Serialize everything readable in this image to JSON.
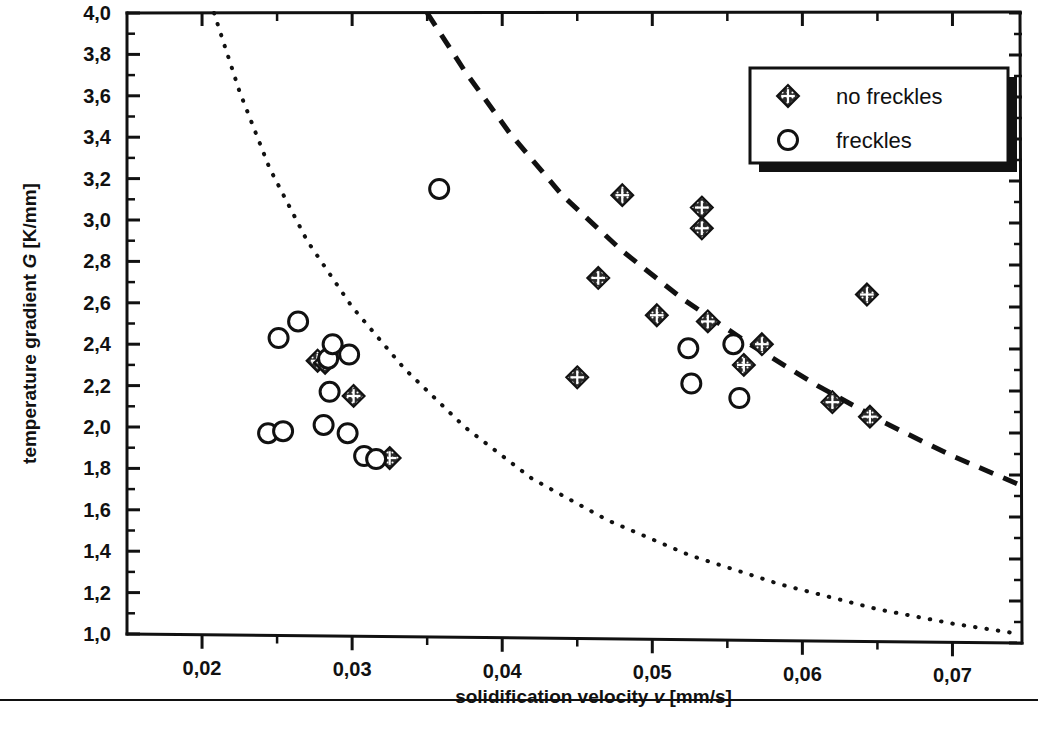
{
  "chart_data": {
    "type": "scatter",
    "title": "",
    "xlabel": "solidification velocity v [mm/s]",
    "xlabel_main": "solidification velocity",
    "xlabel_symbol": "v",
    "xlabel_unit": "[mm/s]",
    "ylabel": "temperature gradient  G [K/mm]",
    "ylabel_main": "temperature gradient",
    "ylabel_symbol": "G",
    "ylabel_unit": "[K/mm]",
    "xlim": [
      0.015,
      0.0745
    ],
    "ylim": [
      1.0,
      4.0
    ],
    "grid": false,
    "x_ticks_major": [
      0.02,
      0.03,
      0.04,
      0.05,
      0.06,
      0.07
    ],
    "x_tick_labels": [
      "0,02",
      "0,03",
      "0,04",
      "0,05",
      "0,06",
      "0,07"
    ],
    "x_ticks_minor": [
      0.025,
      0.035,
      0.045,
      0.055,
      0.065
    ],
    "y_ticks_major": [
      1.0,
      1.2,
      1.4,
      1.6,
      1.8,
      2.0,
      2.2,
      2.4,
      2.6,
      2.8,
      3.0,
      3.2,
      3.4,
      3.6,
      3.8,
      4.0
    ],
    "y_tick_labels": [
      "1,0",
      "1,2",
      "1,4",
      "1,6",
      "1,8",
      "2,0",
      "2,2",
      "2,4",
      "2,6",
      "2,8",
      "3,0",
      "3,2",
      "3,4",
      "3,6",
      "3,8",
      "4,0"
    ],
    "y_ticks_minor": [
      1.1,
      1.3,
      1.5,
      1.7,
      1.9,
      2.1,
      2.3,
      2.5,
      2.7,
      2.9,
      3.1,
      3.3,
      3.5,
      3.7,
      3.9
    ],
    "legend_position": "top-right",
    "series": [
      {
        "name": "no freckles",
        "marker": "diamond-crosshatch",
        "points": [
          [
            0.0301,
            2.15
          ],
          [
            0.0325,
            1.85
          ],
          [
            0.045,
            2.24
          ],
          [
            0.0464,
            2.72
          ],
          [
            0.048,
            3.12
          ],
          [
            0.0503,
            2.54
          ],
          [
            0.0533,
            3.06
          ],
          [
            0.0533,
            2.96
          ],
          [
            0.0537,
            2.51
          ],
          [
            0.0561,
            2.3
          ],
          [
            0.0573,
            2.4
          ],
          [
            0.062,
            2.12
          ],
          [
            0.0643,
            2.64
          ],
          [
            0.0645,
            2.05
          ],
          [
            0.0277,
            2.32
          ],
          [
            0.0282,
            2.31
          ]
        ]
      },
      {
        "name": "freckles",
        "marker": "open-circle",
        "points": [
          [
            0.0244,
            1.97
          ],
          [
            0.0251,
            2.43
          ],
          [
            0.0254,
            1.98
          ],
          [
            0.0264,
            2.51
          ],
          [
            0.0281,
            2.01
          ],
          [
            0.0284,
            2.33
          ],
          [
            0.0285,
            2.17
          ],
          [
            0.0287,
            2.4
          ],
          [
            0.0297,
            1.97
          ],
          [
            0.0298,
            2.35
          ],
          [
            0.0308,
            1.86
          ],
          [
            0.0316,
            1.845
          ],
          [
            0.0358,
            3.15
          ],
          [
            0.0524,
            2.38
          ],
          [
            0.0526,
            2.21
          ],
          [
            0.0554,
            2.4
          ],
          [
            0.0558,
            2.14
          ]
        ]
      }
    ],
    "curves": [
      {
        "name": "lower-criterion-curve",
        "style": "dotted",
        "points": [
          [
            0.0208,
            4.0
          ],
          [
            0.0225,
            3.62
          ],
          [
            0.0245,
            3.25
          ],
          [
            0.027,
            2.9
          ],
          [
            0.03,
            2.58
          ],
          [
            0.0335,
            2.28
          ],
          [
            0.0375,
            2.0
          ],
          [
            0.042,
            1.75
          ],
          [
            0.047,
            1.55
          ],
          [
            0.0525,
            1.38
          ],
          [
            0.0585,
            1.24
          ],
          [
            0.065,
            1.12
          ],
          [
            0.07,
            1.05
          ],
          [
            0.0745,
            1.0
          ]
        ]
      },
      {
        "name": "upper-criterion-curve",
        "style": "dashed",
        "points": [
          [
            0.035,
            4.0
          ],
          [
            0.0375,
            3.72
          ],
          [
            0.0405,
            3.42
          ],
          [
            0.044,
            3.12
          ],
          [
            0.048,
            2.85
          ],
          [
            0.052,
            2.62
          ],
          [
            0.0565,
            2.4
          ],
          [
            0.061,
            2.2
          ],
          [
            0.0655,
            2.02
          ],
          [
            0.07,
            1.86
          ],
          [
            0.0745,
            1.72
          ]
        ]
      }
    ]
  },
  "legend": {
    "entries": [
      {
        "label": "no freckles",
        "marker": "diamond-crosshatch"
      },
      {
        "label": "freckles",
        "marker": "open-circle"
      }
    ]
  }
}
